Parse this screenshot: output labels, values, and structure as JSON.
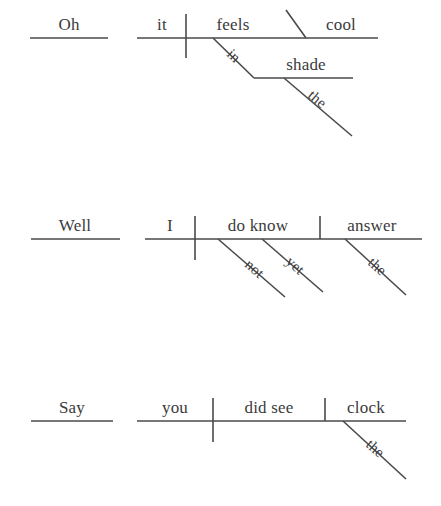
{
  "document": {
    "type": "reed-kellogg-sentence-diagrams",
    "background_color": "#ffffff",
    "line_color": "#4a4a4a",
    "text_color": "#3b3b3b"
  },
  "diagrams": [
    {
      "id": "diagram-1",
      "sentence": "Oh, it feels cool in the shade.",
      "interjection": {
        "word": "Oh"
      },
      "subject": {
        "word": "it"
      },
      "verb": {
        "word": "feels"
      },
      "predicate_adjective": {
        "word": "cool"
      },
      "prepositional_phrase": {
        "preposition": "in",
        "object": "shade",
        "modifier": "the"
      }
    },
    {
      "id": "diagram-2",
      "sentence": "Well, I do not know the answer yet.",
      "interjection": {
        "word": "Well"
      },
      "subject": {
        "word": "I"
      },
      "verb": {
        "word": "do know"
      },
      "direct_object": {
        "word": "answer"
      },
      "adverbs": [
        {
          "word": "not"
        },
        {
          "word": "yet"
        }
      ],
      "article": {
        "word": "the"
      }
    },
    {
      "id": "diagram-3",
      "sentence": "Say, did you see the clock?",
      "interjection": {
        "word": "Say"
      },
      "subject": {
        "word": "you"
      },
      "verb": {
        "word": "did see"
      },
      "direct_object": {
        "word": "clock"
      },
      "article": {
        "word": "the"
      }
    }
  ]
}
